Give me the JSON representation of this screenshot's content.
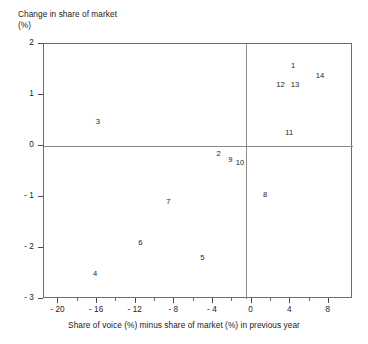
{
  "chart_data": {
    "type": "scatter",
    "title": "",
    "ylabel": "Change in share of market",
    "ylabel_unit": "(%)",
    "xlabel": "Share of voice (%) minus share of market (%) in previous year",
    "xlim": [
      -21.5,
      10.5
    ],
    "ylim": [
      -3,
      2
    ],
    "grid": false,
    "legend": "none",
    "zero_lines": {
      "x": 0,
      "y": 0
    },
    "x_ticks": [
      -20,
      -16,
      -12,
      -8,
      -4,
      0,
      4,
      8
    ],
    "x_tick_labels": [
      "- 20",
      "- 16",
      "- 12",
      "- 8",
      "- 4",
      "0",
      "4",
      "8"
    ],
    "x_minor_ticks": [
      -18,
      -14,
      -10,
      -6,
      -2,
      2,
      6
    ],
    "y_ticks": [
      2,
      1,
      0,
      -1,
      -2,
      -3
    ],
    "y_tick_labels": [
      "2",
      "1",
      "0",
      "- 1",
      "- 2",
      "- 3"
    ],
    "point_label_style": "numeric-brand-id",
    "points": [
      {
        "label": "1",
        "x": 4.4,
        "y": 1.57
      },
      {
        "label": "14",
        "x": 7.2,
        "y": 1.37
      },
      {
        "label": "12",
        "x": 3.1,
        "y": 1.2
      },
      {
        "label": "13",
        "x": 4.6,
        "y": 1.2
      },
      {
        "label": "11",
        "x": 4.0,
        "y": 0.25
      },
      {
        "label": "3",
        "x": -15.8,
        "y": 0.47
      },
      {
        "label": "2",
        "x": -3.3,
        "y": -0.16
      },
      {
        "label": "9",
        "x": -2.1,
        "y": -0.27
      },
      {
        "label": "10",
        "x": -1.1,
        "y": -0.33
      },
      {
        "label": "8",
        "x": 1.5,
        "y": -0.96
      },
      {
        "label": "7",
        "x": -8.5,
        "y": -1.1
      },
      {
        "label": "6",
        "x": -11.4,
        "y": -1.9
      },
      {
        "label": "5",
        "x": -5.0,
        "y": -2.2
      },
      {
        "label": "4",
        "x": -16.1,
        "y": -2.5
      }
    ]
  },
  "colors": {
    "axis": "#4a4a4a",
    "frame": "#6d6d6d",
    "zero_line": "#8a8a8a",
    "text": "#1a1a1a",
    "background": "#ffffff"
  }
}
